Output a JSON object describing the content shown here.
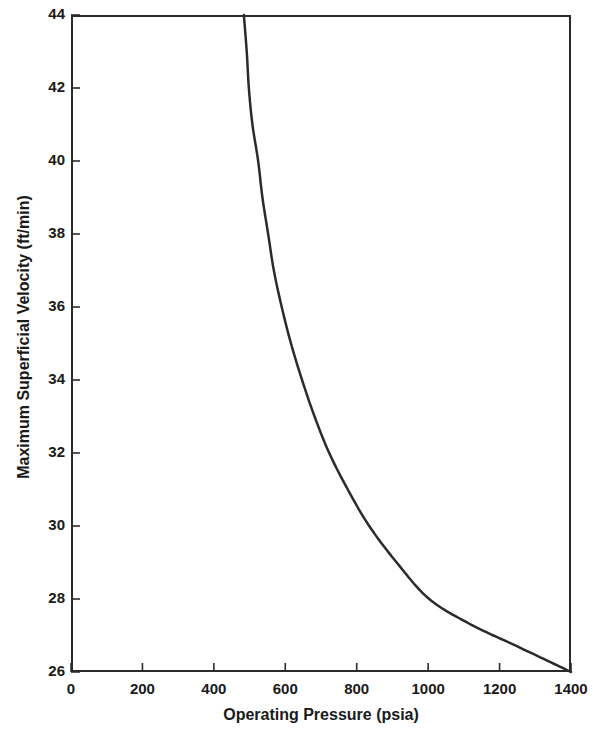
{
  "chart_data": {
    "type": "line",
    "title": "",
    "xlabel": "Operating Pressure (psia)",
    "ylabel": "Maximum Superficial Velocity (ft/min)",
    "xlim": [
      0,
      1400
    ],
    "ylim": [
      26,
      44
    ],
    "xticks": [
      0,
      200,
      400,
      600,
      800,
      1000,
      1200,
      1400
    ],
    "yticks": [
      26,
      28,
      30,
      32,
      34,
      36,
      38,
      40,
      42,
      44
    ],
    "xtick_labels": [
      "0",
      "200",
      "400",
      "600",
      "800",
      "1000",
      "1200",
      "1400"
    ],
    "ytick_labels": [
      "26",
      "28",
      "30",
      "32",
      "34",
      "36",
      "38",
      "40",
      "42",
      "44"
    ],
    "grid": false,
    "legend": null,
    "series": [
      {
        "name": "Maximum Superficial Velocity",
        "color": "#2b2b2b",
        "line_width": 2.5,
        "x": [
          484,
          492,
          498,
          508,
          524,
          536,
          552,
          568,
          590,
          616,
          647,
          682,
          723,
          775,
          835,
          912,
          1003,
          1120,
          1250,
          1400
        ],
        "y": [
          44.0,
          43.0,
          42.0,
          41.0,
          40.0,
          39.0,
          38.0,
          37.0,
          36.0,
          35.0,
          34.0,
          33.0,
          32.0,
          31.0,
          30.0,
          29.0,
          28.0,
          27.3,
          26.7,
          26.0
        ]
      }
    ],
    "annotations": []
  },
  "axes": {
    "frame_color": "#2b2b2b",
    "background": "#ffffff"
  }
}
